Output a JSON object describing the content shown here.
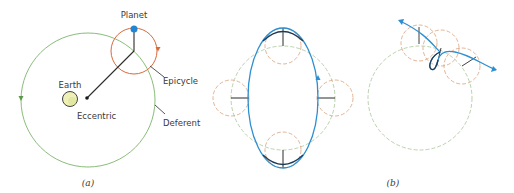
{
  "panel_a": {
    "caption": "(a)",
    "labels": {
      "planet": "Planet",
      "epicycle": "Epicycle",
      "earth": "Earth",
      "eccentric": "Eccentric",
      "deferent": "Deferent"
    }
  },
  "panel_b": {
    "caption": "(b)"
  },
  "colors": {
    "deferent": "#7cb46a",
    "epicycle": "#d9693a",
    "planet_path": "#2e8fd0",
    "planet": "#1f86d6",
    "line": "#2b2b2b",
    "earth_fill": "#eef0b8",
    "dashed_deferent": "#a8c79a",
    "dashed_epicycle": "#d9a27c"
  }
}
